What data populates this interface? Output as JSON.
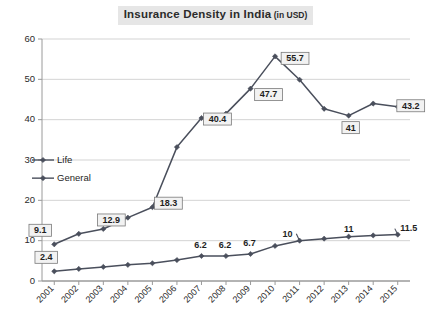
{
  "chart_data": {
    "type": "line",
    "title": "Insurance Density in India",
    "title_unit": "(in USD)",
    "xlabel": "",
    "ylabel": "",
    "ylim": [
      0,
      60
    ],
    "ytick_values": [
      0,
      10,
      20,
      30,
      40,
      50,
      60
    ],
    "ytick_labels": [
      "0",
      "10",
      "20",
      "30",
      "40",
      "50",
      "60"
    ],
    "grid": true,
    "legend_position": "inside-left",
    "categories": [
      "2001",
      "2002",
      "2003",
      "2004",
      "2005",
      "2006",
      "2007",
      "2008",
      "2009",
      "2010",
      "2011",
      "2012",
      "2013",
      "2014",
      "2015"
    ],
    "series": [
      {
        "name": "Life",
        "values": [
          9.1,
          11.7,
          12.9,
          15.7,
          18.3,
          33.2,
          40.4,
          41.5,
          47.7,
          55.7,
          49.9,
          42.7,
          41.0,
          44.0,
          43.2
        ]
      },
      {
        "name": "General",
        "values": [
          2.4,
          3.0,
          3.5,
          4.0,
          4.4,
          5.2,
          6.2,
          6.2,
          6.7,
          8.7,
          10.0,
          10.5,
          11.0,
          11.3,
          11.5
        ]
      }
    ],
    "annotations": [
      {
        "series": "Life",
        "category": "2001",
        "value": 9.1,
        "label": "9.1",
        "boxed": true
      },
      {
        "series": "Life",
        "category": "2003",
        "value": 12.9,
        "label": "12.9",
        "boxed": true
      },
      {
        "series": "Life",
        "category": "2005",
        "value": 18.3,
        "label": "18.3",
        "boxed": true
      },
      {
        "series": "Life",
        "category": "2007",
        "value": 40.4,
        "label": "40.4",
        "boxed": true
      },
      {
        "series": "Life",
        "category": "2009",
        "value": 47.7,
        "label": "47.7",
        "boxed": true
      },
      {
        "series": "Life",
        "category": "2010",
        "value": 55.7,
        "label": "55.7",
        "boxed": true
      },
      {
        "series": "Life",
        "category": "2013",
        "value": 41.0,
        "label": "41",
        "boxed": true
      },
      {
        "series": "Life",
        "category": "2015",
        "value": 43.2,
        "label": "43.2",
        "boxed": true
      },
      {
        "series": "General",
        "category": "2001",
        "value": 2.4,
        "label": "2.4",
        "boxed": true
      },
      {
        "series": "General",
        "category": "2007",
        "value": 6.2,
        "label": "6.2",
        "boxed": false
      },
      {
        "series": "General",
        "category": "2008",
        "value": 6.2,
        "label": "6.2",
        "boxed": false
      },
      {
        "series": "General",
        "category": "2009",
        "value": 6.7,
        "label": "6.7",
        "boxed": false
      },
      {
        "series": "General",
        "category": "2011",
        "value": 10.0,
        "label": "10",
        "boxed": false
      },
      {
        "series": "General",
        "category": "2013",
        "value": 11.0,
        "label": "11",
        "boxed": false
      },
      {
        "series": "General",
        "category": "2015",
        "value": 11.5,
        "label": "11.5",
        "boxed": false
      }
    ],
    "legend": [
      {
        "label": "Life"
      },
      {
        "label": "General"
      }
    ],
    "colors": {
      "series_line": "#4a4f5c",
      "marker": "#4a4f5c",
      "grid": "#c8c8c8",
      "axis": "#9a9a9a",
      "title_highlight": "#e6e6e6",
      "callout_fill": "#f2f2f2",
      "callout_border": "#7a7a7a",
      "background": "#ffffff"
    }
  }
}
